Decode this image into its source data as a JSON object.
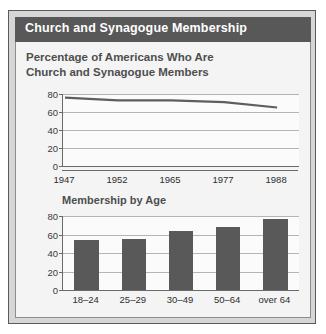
{
  "panel": {
    "title": "Church and Synagogue Membership",
    "subtitle_line1": "Percentage of Americans Who Are",
    "subtitle_line2": "Church and Synagogue Members",
    "colors": {
      "title_bar": "#585858",
      "panel_background": "#f4f4f4",
      "figure_background": "#d6d6d6",
      "bar_fill": "#595959",
      "line_stroke": "#5e5e5e"
    }
  },
  "chart_data": [
    {
      "type": "line",
      "title": "Percentage of Americans Who Are Church and Synagogue Members",
      "xlabel": "",
      "ylabel": "",
      "categories": [
        "1947",
        "1952",
        "1965",
        "1977",
        "1988"
      ],
      "x": [
        1947,
        1952,
        1965,
        1977,
        1988
      ],
      "values": [
        76,
        73,
        73,
        71,
        65
      ],
      "ylim": [
        0,
        80
      ],
      "yticks": [
        0,
        20,
        40,
        60,
        80
      ],
      "grid": true,
      "legend": "none"
    },
    {
      "type": "bar",
      "title": "Membership by Age",
      "xlabel": "",
      "ylabel": "",
      "categories": [
        "18–24",
        "25–29",
        "30–49",
        "50–64",
        "over 64"
      ],
      "values": [
        54,
        55,
        64,
        68,
        77
      ],
      "ylim": [
        0,
        80
      ],
      "yticks": [
        0,
        20,
        40,
        60,
        80
      ],
      "grid": true,
      "legend": "none"
    }
  ]
}
